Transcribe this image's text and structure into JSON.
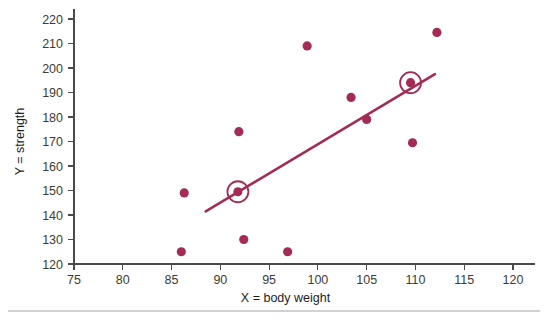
{
  "chart_data": {
    "type": "scatter",
    "title": "",
    "xlabel": "X = body weight",
    "ylabel": "Y = strength",
    "xlim": [
      75,
      120
    ],
    "ylim": [
      120,
      220
    ],
    "xticks": [
      75,
      80,
      85,
      90,
      95,
      100,
      105,
      110,
      115,
      120
    ],
    "yticks": [
      120,
      130,
      140,
      150,
      160,
      170,
      180,
      190,
      200,
      210,
      220
    ],
    "grid": false,
    "legend": null,
    "point_color": "#a32b55",
    "line_color": "#a32b55",
    "axis_color": "#4a4a4a",
    "points": [
      {
        "x": 86.0,
        "y": 125,
        "highlighted": false
      },
      {
        "x": 86.3,
        "y": 149,
        "highlighted": false
      },
      {
        "x": 91.8,
        "y": 149.5,
        "highlighted": true
      },
      {
        "x": 91.9,
        "y": 174,
        "highlighted": false
      },
      {
        "x": 92.4,
        "y": 130,
        "highlighted": false
      },
      {
        "x": 96.9,
        "y": 125,
        "highlighted": false
      },
      {
        "x": 98.9,
        "y": 209,
        "highlighted": false
      },
      {
        "x": 103.4,
        "y": 188,
        "highlighted": false
      },
      {
        "x": 105.0,
        "y": 179,
        "highlighted": false
      },
      {
        "x": 109.5,
        "y": 194,
        "highlighted": true
      },
      {
        "x": 109.7,
        "y": 169.5,
        "highlighted": false
      },
      {
        "x": 112.2,
        "y": 214.5,
        "highlighted": false
      }
    ],
    "regression_line": {
      "x1": 88.5,
      "y1": 141.5,
      "x2": 112.0,
      "y2": 197.5
    },
    "annotations": [
      {
        "kind": "circle-marker",
        "x": 91.8,
        "y": 149.5,
        "note": "highlighted observation"
      },
      {
        "kind": "circle-marker",
        "x": 109.5,
        "y": 194,
        "note": "highlighted observation"
      }
    ]
  },
  "labels": {
    "x_axis_title": "X = body weight",
    "y_axis_title": "Y = strength"
  }
}
